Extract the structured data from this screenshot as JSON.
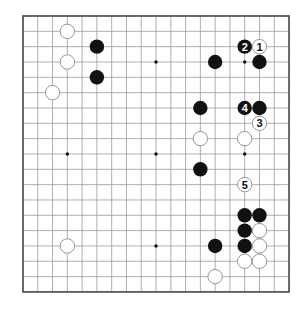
{
  "board": {
    "size": 19,
    "origin_x": 23,
    "origin_y": 16,
    "spacing_x": 14.78,
    "spacing_y": 15.33,
    "stone_radius": 7.2,
    "star_points": [
      [
        3,
        3
      ],
      [
        3,
        9
      ],
      [
        3,
        15
      ],
      [
        9,
        3
      ],
      [
        9,
        9
      ],
      [
        9,
        15
      ],
      [
        15,
        3
      ],
      [
        15,
        9
      ],
      [
        15,
        15
      ]
    ],
    "colors": {
      "line": "#9a9a9a",
      "frame": "#444444",
      "black": "#111111",
      "white_fill": "#ffffff",
      "white_stroke": "#8a8a8a"
    }
  },
  "stones": [
    {
      "color": "white",
      "col": 3,
      "row": 1
    },
    {
      "color": "black",
      "col": 5,
      "row": 2
    },
    {
      "color": "white",
      "col": 3,
      "row": 3
    },
    {
      "color": "black",
      "col": 5,
      "row": 4
    },
    {
      "color": "white",
      "col": 2,
      "row": 5
    },
    {
      "color": "black",
      "col": 15,
      "row": 2,
      "label": "2"
    },
    {
      "color": "white",
      "col": 16,
      "row": 2,
      "label": "1"
    },
    {
      "color": "black",
      "col": 13,
      "row": 3
    },
    {
      "color": "black",
      "col": 16,
      "row": 3
    },
    {
      "color": "black",
      "col": 12,
      "row": 6
    },
    {
      "color": "black",
      "col": 15,
      "row": 6,
      "label": "4"
    },
    {
      "color": "black",
      "col": 16,
      "row": 6
    },
    {
      "color": "white",
      "col": 16,
      "row": 7,
      "label": "3"
    },
    {
      "color": "white",
      "col": 12,
      "row": 8
    },
    {
      "color": "white",
      "col": 15,
      "row": 8
    },
    {
      "color": "black",
      "col": 12,
      "row": 10
    },
    {
      "color": "white",
      "col": 15,
      "row": 11,
      "label": "5"
    },
    {
      "color": "black",
      "col": 15,
      "row": 13
    },
    {
      "color": "black",
      "col": 16,
      "row": 13
    },
    {
      "color": "black",
      "col": 15,
      "row": 14
    },
    {
      "color": "white",
      "col": 16,
      "row": 14
    },
    {
      "color": "black",
      "col": 13,
      "row": 15
    },
    {
      "color": "black",
      "col": 15,
      "row": 15
    },
    {
      "color": "white",
      "col": 16,
      "row": 15
    },
    {
      "color": "white",
      "col": 3,
      "row": 15
    },
    {
      "color": "white",
      "col": 15,
      "row": 16
    },
    {
      "color": "white",
      "col": 16,
      "row": 16
    },
    {
      "color": "white",
      "col": 13,
      "row": 17
    }
  ]
}
